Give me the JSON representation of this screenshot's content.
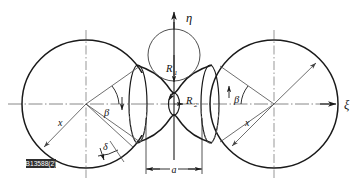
{
  "figure": {
    "type": "technical-line-diagram",
    "background_color": "#ffffff",
    "line_color": "#1a1a1a",
    "thin_line_color": "#555555",
    "centerline_color": "#666666"
  },
  "axes": {
    "horizontal": {
      "name": "xi-axis",
      "label": "ξ",
      "label_x": 344,
      "label_y": 104,
      "y": 104,
      "x_start": 8,
      "x_end": 336,
      "arrow": "right"
    },
    "vertical": {
      "name": "eta-axis",
      "label": "η",
      "label_x": 186,
      "label_y": 20,
      "x": 174,
      "y_start": 160,
      "y_end": 12,
      "arrow": "up"
    }
  },
  "circles": {
    "left": {
      "cx": 86,
      "cy": 104,
      "r": 64
    },
    "right": {
      "cx": 274,
      "cy": 104,
      "r": 64
    },
    "inscribed_top": {
      "cx": 174,
      "cy": 55,
      "r": 26
    }
  },
  "centerlines": [
    {
      "name": "left-circle-centerline",
      "x": 86
    },
    {
      "name": "right-circle-centerline",
      "x": 274
    }
  ],
  "labels": [
    {
      "name": "radius-R1",
      "text": "R",
      "sub": "1",
      "x": 168,
      "y": 68
    },
    {
      "name": "radius-R2",
      "text": "R",
      "sub": "2",
      "x": 188,
      "y": 101
    },
    {
      "name": "angle-beta-left",
      "text": "β",
      "x": 106,
      "y": 112
    },
    {
      "name": "angle-beta-right",
      "text": "β",
      "x": 236,
      "y": 100
    },
    {
      "name": "angle-delta",
      "text": "δ",
      "x": 104,
      "y": 147
    },
    {
      "name": "radius-x-left",
      "text": "x",
      "x": 60,
      "y": 122
    },
    {
      "name": "radius-x-right",
      "text": "x",
      "x": 247,
      "y": 122
    },
    {
      "name": "dimension-a",
      "text": "a",
      "x": 176,
      "y": 172
    }
  ],
  "dimension": {
    "name": "waist-width-a",
    "label": "a",
    "y": 169,
    "x_left": 146,
    "x_right": 202,
    "extension_top": 118
  },
  "stamp": {
    "name": "figure-id-stamp",
    "text": "B13588(2)",
    "x": 26,
    "y": 159,
    "width": 30,
    "height": 9
  }
}
